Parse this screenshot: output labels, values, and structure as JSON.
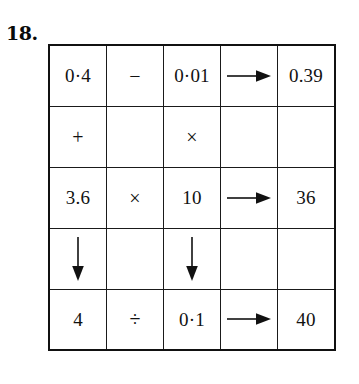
{
  "question": {
    "number_label": "18."
  },
  "grid": {
    "rows": 5,
    "cols": 5,
    "border_color": "#111111",
    "hatch_color": "#141414",
    "background": "#ffffff",
    "cells": [
      [
        {
          "type": "value",
          "text": "0·4",
          "name": "cell-r1c1-value"
        },
        {
          "type": "operator",
          "text": "−",
          "name": "cell-r1c2-minus-operator"
        },
        {
          "type": "value",
          "text": "0·01",
          "name": "cell-r1c3-value"
        },
        {
          "type": "arrow",
          "text": "",
          "name": "cell-r1c4-arrow-right",
          "direction": "right"
        },
        {
          "type": "value",
          "text": "0.39",
          "name": "cell-r1c5-result"
        }
      ],
      [
        {
          "type": "operator",
          "text": "+",
          "name": "cell-r2c1-plus-operator"
        },
        {
          "type": "hatched",
          "text": "",
          "name": "cell-r2c2-hatched"
        },
        {
          "type": "operator",
          "text": "×",
          "name": "cell-r2c3-times-operator"
        },
        {
          "type": "hatched",
          "text": "",
          "name": "cell-r2c4-hatched"
        },
        {
          "type": "hatched",
          "text": "",
          "name": "cell-r2c5-hatched"
        }
      ],
      [
        {
          "type": "value",
          "text": "3.6",
          "name": "cell-r3c1-value"
        },
        {
          "type": "operator",
          "text": "×",
          "name": "cell-r3c2-times-operator"
        },
        {
          "type": "value",
          "text": "10",
          "name": "cell-r3c3-value"
        },
        {
          "type": "arrow",
          "text": "",
          "name": "cell-r3c4-arrow-right",
          "direction": "right"
        },
        {
          "type": "value",
          "text": "36",
          "name": "cell-r3c5-result"
        }
      ],
      [
        {
          "type": "arrow",
          "text": "",
          "name": "cell-r4c1-arrow-down",
          "direction": "down"
        },
        {
          "type": "hatched",
          "text": "",
          "name": "cell-r4c2-hatched"
        },
        {
          "type": "arrow",
          "text": "",
          "name": "cell-r4c3-arrow-down",
          "direction": "down"
        },
        {
          "type": "hatched",
          "text": "",
          "name": "cell-r4c4-hatched"
        },
        {
          "type": "hatched",
          "text": "",
          "name": "cell-r4c5-hatched"
        }
      ],
      [
        {
          "type": "value",
          "text": "4",
          "name": "cell-r5c1-value"
        },
        {
          "type": "operator",
          "text": "÷",
          "name": "cell-r5c2-divide-operator"
        },
        {
          "type": "value",
          "text": "0·1",
          "name": "cell-r5c3-value"
        },
        {
          "type": "arrow",
          "text": "",
          "name": "cell-r5c4-arrow-right",
          "direction": "right"
        },
        {
          "type": "value",
          "text": "40",
          "name": "cell-r5c5-result"
        }
      ]
    ]
  }
}
